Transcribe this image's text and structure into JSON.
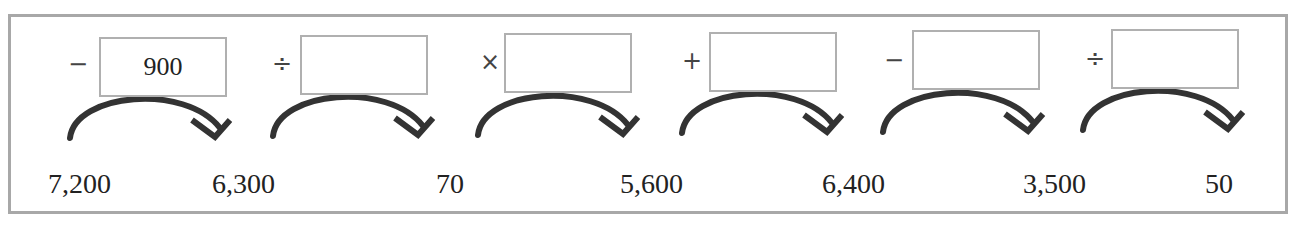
{
  "diagram": {
    "type": "number-chain",
    "steps": [
      {
        "operator": "−",
        "operator_name": "minus",
        "value": "900"
      },
      {
        "operator": "÷",
        "operator_name": "divide",
        "value": ""
      },
      {
        "operator": "×",
        "operator_name": "multiply",
        "value": ""
      },
      {
        "operator": "+",
        "operator_name": "plus",
        "value": ""
      },
      {
        "operator": "−",
        "operator_name": "minus",
        "value": ""
      },
      {
        "operator": "÷",
        "operator_name": "divide",
        "value": ""
      }
    ],
    "numbers": [
      "7,200",
      "6,300",
      "70",
      "5,600",
      "6,400",
      "3,500",
      "50"
    ]
  }
}
